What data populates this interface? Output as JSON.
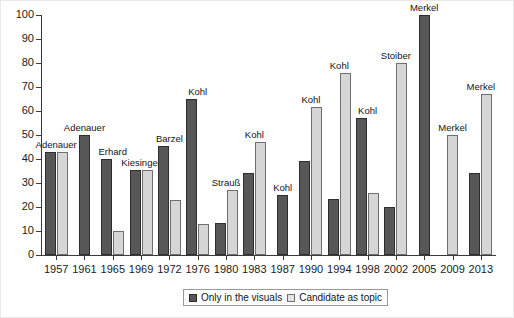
{
  "chart_data": {
    "type": "bar",
    "title": "",
    "subtitle": "",
    "xlabel": "",
    "ylabel": "",
    "ylim": [
      0,
      100
    ],
    "ytick_step": 10,
    "yticks": [
      "0",
      "10",
      "20",
      "30",
      "40",
      "50",
      "60",
      "70",
      "80",
      "90",
      "100"
    ],
    "grid": false,
    "legend_position": "bottom-center",
    "categories": [
      "1957",
      "1961",
      "1965",
      "1969",
      "1972",
      "1976",
      "1980",
      "1983",
      "1987",
      "1990",
      "1994",
      "1998",
      "2002",
      "2005",
      "2009",
      "2013"
    ],
    "series": [
      {
        "name": "Only in the visuals",
        "color": "#575757",
        "values": [
          43,
          50,
          40,
          35.5,
          45.5,
          65,
          13.5,
          34,
          25,
          39,
          23.5,
          57,
          20,
          100,
          null,
          34
        ]
      },
      {
        "name": "Candidate as topic",
        "color": "#d6d6d6",
        "values": [
          43,
          null,
          10,
          35.5,
          23,
          13,
          27,
          47,
          null,
          61.5,
          76,
          26,
          80,
          null,
          50,
          67
        ]
      }
    ],
    "annotations": [
      "Adenauer",
      "Adenauer",
      "Erhard",
      "Kiesinger",
      "Barzel",
      "Kohl",
      "Strauß",
      "Kohl",
      "Kohl",
      "Kohl",
      "Kohl",
      "Kohl",
      "Stoiber",
      "Merkel",
      "Merkel",
      "Merkel"
    ]
  },
  "legend": {
    "items": [
      {
        "label": "Only in the visuals",
        "swatch": "dark-swatch-icon"
      },
      {
        "label": "Candidate as topic",
        "swatch": "light-swatch-icon"
      }
    ]
  },
  "colors": {
    "series_dark": "#575757",
    "series_light": "#d6d6d6",
    "axis": "#3a3a3a",
    "text": "#141414",
    "background": "#ffffff"
  }
}
